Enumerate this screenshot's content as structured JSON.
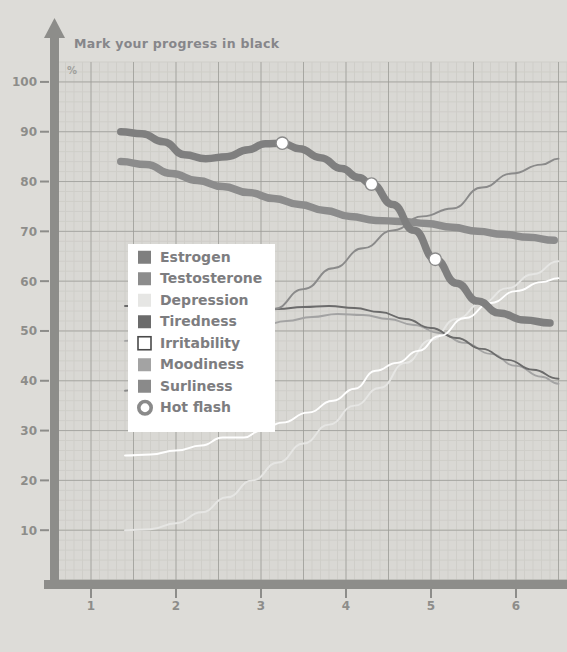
{
  "title": "Mark your progress in black",
  "unit_label": "%",
  "colors": {
    "background": "#dddcd8",
    "plot_background": "#d9d8d4",
    "grid_minor": "#cfcec9",
    "grid_major": "#9a9a96",
    "axis": "#8d8d8a",
    "tick_text": "#8d8d8a",
    "legend_background": "#ffffff",
    "estrogen": "#7f7f7f",
    "testosterone": "#8c8c8c",
    "depression": "#e6e6e4",
    "tiredness": "#6b6b6b",
    "irritability": "#ffffff",
    "moodiness": "#a3a3a3",
    "surliness": "#8a8a8a",
    "hot_flash_ring": "#8a8a8a",
    "hot_flash_fill": "#ffffff"
  },
  "legend": {
    "items": [
      {
        "label": "Estrogen",
        "swatch": "estrogen",
        "style": "filled"
      },
      {
        "label": "Testosterone",
        "swatch": "testosterone",
        "style": "filled"
      },
      {
        "label": "Depression",
        "swatch": "depression",
        "style": "filled"
      },
      {
        "label": "Tiredness",
        "swatch": "tiredness",
        "style": "filled"
      },
      {
        "label": "Irritability",
        "swatch": "irritability",
        "style": "outlined"
      },
      {
        "label": "Moodiness",
        "swatch": "moodiness",
        "style": "filled"
      },
      {
        "label": "Surliness",
        "swatch": "surliness",
        "style": "filled"
      },
      {
        "label": "Hot flash",
        "swatch": "hot_flash_ring",
        "style": "ring"
      }
    ]
  },
  "chart_data": {
    "type": "line",
    "title": "Mark your progress in black",
    "xlabel": "",
    "ylabel": "%",
    "xlim": [
      0.6,
      6.6
    ],
    "ylim": [
      0,
      104
    ],
    "grid": true,
    "grid_minor_step_x": 0.1,
    "grid_minor_step_y": 2,
    "grid_major_step_x": 0.5,
    "grid_major_step_y": 10,
    "legend_position": "inside-left",
    "xticks": [
      1,
      2,
      3,
      4,
      5,
      6
    ],
    "xtick_labels": [
      "1",
      "2",
      "3",
      "4",
      "5",
      "6"
    ],
    "yticks": [
      10,
      20,
      30,
      40,
      50,
      60,
      70,
      80,
      90,
      100
    ],
    "ytick_labels": [
      "10",
      "20",
      "30",
      "40",
      "50",
      "60",
      "70",
      "80",
      "90",
      "100"
    ],
    "series": [
      {
        "name": "Estrogen",
        "color": "estrogen",
        "width": "thick",
        "x": [
          1.35,
          1.6,
          1.85,
          2.1,
          2.35,
          2.6,
          2.85,
          3.05,
          3.25,
          3.45,
          3.7,
          3.95,
          4.15,
          4.3,
          4.55,
          4.8,
          5.05,
          5.3,
          5.55,
          5.8,
          6.1,
          6.4
        ],
        "y": [
          90.0,
          89.6,
          88.0,
          85.4,
          84.6,
          85.0,
          86.4,
          87.6,
          87.7,
          86.6,
          84.8,
          82.6,
          80.8,
          79.5,
          75.4,
          70.2,
          64.4,
          59.6,
          56.0,
          53.6,
          52.2,
          51.6
        ]
      },
      {
        "name": "Testosterone",
        "color": "testosterone",
        "width": "thick",
        "x": [
          1.35,
          1.65,
          1.95,
          2.25,
          2.55,
          2.85,
          3.15,
          3.45,
          3.75,
          4.05,
          4.35,
          4.65,
          4.95,
          5.25,
          5.55,
          5.85,
          6.15,
          6.45
        ],
        "y": [
          84.0,
          83.4,
          81.6,
          80.2,
          79.0,
          77.8,
          76.6,
          75.4,
          74.2,
          73.0,
          72.2,
          72.0,
          71.6,
          70.8,
          70.0,
          69.4,
          68.8,
          68.2
        ]
      },
      {
        "name": "Tiredness",
        "color": "tiredness",
        "width": "thin",
        "x": [
          1.4,
          1.7,
          2.0,
          2.3,
          2.6,
          2.9,
          3.2,
          3.5,
          3.8,
          4.1,
          4.4,
          4.7,
          5.0,
          5.3,
          5.6,
          5.9,
          6.2,
          6.5
        ],
        "y": [
          55.0,
          55.0,
          54.6,
          54.4,
          54.2,
          54.2,
          54.4,
          54.8,
          55.0,
          54.6,
          53.8,
          52.4,
          50.6,
          48.6,
          46.4,
          44.2,
          42.2,
          40.4
        ]
      },
      {
        "name": "Surliness",
        "color": "surliness",
        "width": "thin",
        "x": [
          1.4,
          1.75,
          2.1,
          2.45,
          2.8,
          3.15,
          3.5,
          3.85,
          4.2,
          4.55,
          4.9,
          5.25,
          5.6,
          5.95,
          6.3,
          6.5
        ],
        "y": [
          38.0,
          39.8,
          43.0,
          46.6,
          50.4,
          54.4,
          58.4,
          62.6,
          66.6,
          70.2,
          73.0,
          74.6,
          78.8,
          81.6,
          83.4,
          84.6
        ]
      },
      {
        "name": "Moodiness",
        "color": "moodiness",
        "width": "thin",
        "x": [
          1.4,
          1.8,
          2.2,
          2.6,
          3.0,
          3.3,
          3.6,
          3.9,
          4.2,
          4.5,
          4.8,
          5.1,
          5.4,
          5.7,
          6.0,
          6.3,
          6.5
        ],
        "y": [
          48.0,
          48.6,
          49.2,
          50.0,
          51.0,
          52.0,
          52.8,
          53.4,
          53.2,
          52.4,
          51.2,
          49.6,
          47.6,
          45.4,
          43.0,
          40.8,
          39.4
        ]
      },
      {
        "name": "Depression",
        "color": "depression",
        "width": "thin",
        "x": [
          1.4,
          1.7,
          2.0,
          2.3,
          2.6,
          2.9,
          3.2,
          3.5,
          3.8,
          4.1,
          4.4,
          4.7,
          5.0,
          5.3,
          5.6,
          5.9,
          6.2,
          6.5
        ],
        "y": [
          10.0,
          10.2,
          11.4,
          13.6,
          16.6,
          20.0,
          23.6,
          27.4,
          31.2,
          35.0,
          38.6,
          43.6,
          48.2,
          52.4,
          55.6,
          58.6,
          61.4,
          64.0
        ]
      },
      {
        "name": "Irritability",
        "color": "irritability",
        "width": "thin",
        "x": [
          1.4,
          1.7,
          2.0,
          2.3,
          2.55,
          2.8,
          3.0,
          3.25,
          3.55,
          3.85,
          4.1,
          4.35,
          4.6,
          4.85,
          5.1,
          5.4,
          5.7,
          6.0,
          6.3,
          6.5
        ],
        "y": [
          25.0,
          25.2,
          26.0,
          27.0,
          28.6,
          28.6,
          30.0,
          31.6,
          33.6,
          36.0,
          38.4,
          42.0,
          43.6,
          46.0,
          49.0,
          52.6,
          55.6,
          58.0,
          59.8,
          60.6
        ]
      }
    ],
    "markers": {
      "name": "Hot flash",
      "points": [
        {
          "x": 3.25,
          "y": 87.7
        },
        {
          "x": 4.3,
          "y": 79.5
        },
        {
          "x": 5.05,
          "y": 64.4
        }
      ]
    }
  }
}
